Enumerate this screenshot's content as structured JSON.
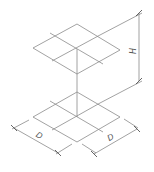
{
  "figure": {
    "labels": {
      "height": "H",
      "depth_left": "D",
      "depth_right": "D"
    },
    "line_color": "#8a8a8a",
    "dimension_color": "#7a7a7a",
    "text_color": "#555555"
  }
}
